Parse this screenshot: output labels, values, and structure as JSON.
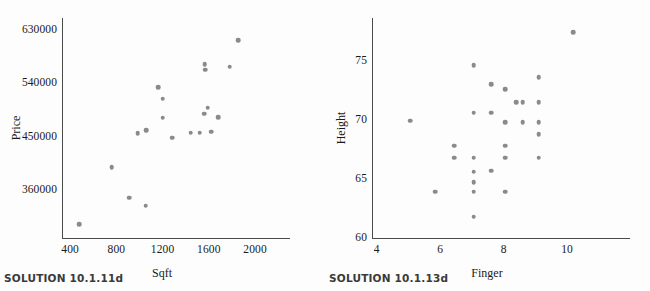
{
  "figures": [
    {
      "id": "left",
      "caption": "SOLUTION 10.1.11d",
      "chart_data": {
        "type": "scatter",
        "title": "",
        "xlabel": "Sqft",
        "ylabel": "Price",
        "xlim": [
          330,
          2060
        ],
        "ylim": [
          280000,
          650000
        ],
        "xticks": [
          400,
          800,
          1200,
          1600,
          2000
        ],
        "yticks": [
          360000,
          450000,
          540000,
          630000
        ],
        "xtick_labels": [
          "400",
          "800",
          "1200",
          "1600",
          "2000"
        ],
        "ytick_labels": [
          "360000",
          "450000",
          "540000",
          "630000"
        ],
        "grid": false,
        "legend": false,
        "marker_color": "#8a8a8a",
        "points": [
          {
            "x": 480,
            "y": 303000
          },
          {
            "x": 760,
            "y": 399000
          },
          {
            "x": 910,
            "y": 348000
          },
          {
            "x": 1055,
            "y": 334000
          },
          {
            "x": 985,
            "y": 456000
          },
          {
            "x": 1060,
            "y": 461000
          },
          {
            "x": 1160,
            "y": 534000
          },
          {
            "x": 1200,
            "y": 514000
          },
          {
            "x": 1200,
            "y": 482000
          },
          {
            "x": 1285,
            "y": 449000
          },
          {
            "x": 1445,
            "y": 457000
          },
          {
            "x": 1520,
            "y": 457000
          },
          {
            "x": 1560,
            "y": 489000
          },
          {
            "x": 1565,
            "y": 572000
          },
          {
            "x": 1568,
            "y": 563000
          },
          {
            "x": 1590,
            "y": 499000
          },
          {
            "x": 1620,
            "y": 459000
          },
          {
            "x": 1680,
            "y": 483000
          },
          {
            "x": 1780,
            "y": 568000
          },
          {
            "x": 1855,
            "y": 613000
          }
        ]
      }
    },
    {
      "id": "right",
      "caption": "SOLUTION 10.1.13d",
      "chart_data": {
        "type": "scatter",
        "title": "",
        "xlabel": "Finger",
        "ylabel": "Height",
        "xlim": [
          3.85,
          11.1
        ],
        "ylim": [
          60,
          78.6
        ],
        "xticks": [
          4,
          6,
          8,
          10
        ],
        "yticks": [
          60,
          65,
          70,
          75
        ],
        "xtick_labels": [
          "4",
          "6",
          "8",
          "10"
        ],
        "ytick_labels": [
          "60",
          "65",
          "70",
          "75"
        ],
        "grid": false,
        "legend": false,
        "marker_color": "#8a8a8a",
        "points": [
          {
            "x": 5.05,
            "y": 69.9
          },
          {
            "x": 5.85,
            "y": 63.9
          },
          {
            "x": 6.45,
            "y": 67.8
          },
          {
            "x": 6.45,
            "y": 66.8
          },
          {
            "x": 7.05,
            "y": 74.6
          },
          {
            "x": 7.05,
            "y": 70.6
          },
          {
            "x": 7.05,
            "y": 66.8
          },
          {
            "x": 7.05,
            "y": 65.6
          },
          {
            "x": 7.05,
            "y": 64.7
          },
          {
            "x": 7.05,
            "y": 63.9
          },
          {
            "x": 7.05,
            "y": 61.8
          },
          {
            "x": 7.6,
            "y": 73.0
          },
          {
            "x": 7.6,
            "y": 70.6
          },
          {
            "x": 7.6,
            "y": 65.7
          },
          {
            "x": 8.05,
            "y": 72.6
          },
          {
            "x": 8.05,
            "y": 69.8
          },
          {
            "x": 8.05,
            "y": 67.8
          },
          {
            "x": 8.05,
            "y": 66.8
          },
          {
            "x": 8.05,
            "y": 63.9
          },
          {
            "x": 8.4,
            "y": 71.5
          },
          {
            "x": 8.6,
            "y": 71.5
          },
          {
            "x": 8.6,
            "y": 69.8
          },
          {
            "x": 9.1,
            "y": 73.6
          },
          {
            "x": 9.1,
            "y": 71.5
          },
          {
            "x": 9.1,
            "y": 69.8
          },
          {
            "x": 9.1,
            "y": 68.8
          },
          {
            "x": 9.1,
            "y": 66.8
          },
          {
            "x": 10.2,
            "y": 77.4
          }
        ]
      }
    }
  ]
}
